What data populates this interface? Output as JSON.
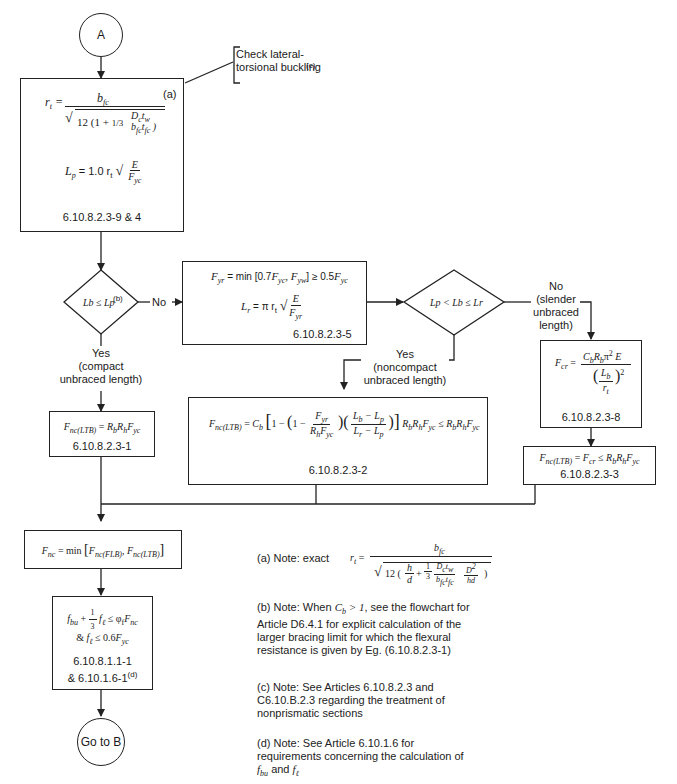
{
  "connectors": {
    "start": "A",
    "end": "Go to B"
  },
  "callout": {
    "text": "Check lateral-torsional buckling",
    "footnote_ref": "(c)"
  },
  "box_rt": {
    "tag": "(a)",
    "rt_formula": "r_t = b_fc / sqrt(12 (1 + (1/3) (D_c t_w)/(b_fc t_fc)))",
    "lp_formula": "L_p = 1.0 r_t sqrt(E / F_yc)",
    "reference": "6.10.8.2.3-9 & 4"
  },
  "decision1": {
    "condition": "Lb ≤ Lp",
    "footnote_ref": "(b)",
    "no_label": "No",
    "yes_label": "Yes",
    "yes_sub1": "(compact",
    "yes_sub2": "unbraced length)"
  },
  "box_fyr": {
    "fyr_formula": "F_yr = min[0.7F_yc, F_yw] ≥ 0.5F_yc",
    "lr_formula": "L_r = π r_t sqrt(E / F_yr)",
    "reference": "6.10.8.2.3-5"
  },
  "decision2": {
    "condition": "Lp < Lb ≤ Lr",
    "no_label": "No",
    "no_sub1": "(slender",
    "no_sub2": "unbraced",
    "no_sub3": "length)",
    "yes_label": "Yes",
    "yes_sub1": "(noncompact",
    "yes_sub2": "unbraced length)"
  },
  "box_compact": {
    "formula": "F_nc(LTB) = R_b R_h F_yc",
    "reference": "6.10.8.2.3-1"
  },
  "box_noncompact": {
    "formula": "F_nc(LTB) = C_b [1 − (1 − F_yr/(R_h F_yc)) ((L_b − L_p)/(L_r − L_p))] R_b R_h F_yc ≤ R_b R_h F_yc",
    "reference": "6.10.8.2.3-2"
  },
  "box_fcr": {
    "formula": "F_cr = C_b R_b π² E / (L_b / r_t)²",
    "reference": "6.10.8.2.3-8"
  },
  "box_slender": {
    "formula": "F_nc(LTB) = F_cr ≤ R_b R_h F_yc",
    "reference": "6.10.8.2.3-3"
  },
  "box_fnc": {
    "formula": "F_nc = min[F_nc(FLB), F_nc(LTB)]"
  },
  "box_check": {
    "formula1": "f_bu + (1/3) f_ℓ ≤ φ_f F_nc",
    "formula2": "& f_ℓ ≤ 0.6F_yc",
    "reference1": "6.10.8.1.1-1",
    "reference2": "& 6.10.1.6-1",
    "reference2_sup": "(d)"
  },
  "notes": {
    "a_prefix": "(a) Note: exact",
    "a_formula": "r_t = b_fc / sqrt(12 (h/d + (1/3) (D_c t_w)/(b_fc t_fc) D²/(h d)))",
    "b_prefix": "(b) Note: When",
    "b_cond": "C_b > 1",
    "b_text": ", see the flowchart for Article D6.4.1 for explicit calculation of the larger bracing limit for which the flexural resistance is given by Eg. (6.10.8.2.3-1)",
    "c_text": "(c) Note: See Articles 6.10.8.2.3 and C6.10.B.2.3 regarding the treatment of nonprismatic sections",
    "d_text": "(d) Note: See Article 6.10.1.6 for requirements concerning the calculation of",
    "d_var1": "f_bu",
    "d_and": "and",
    "d_var2": "f_ℓ"
  }
}
